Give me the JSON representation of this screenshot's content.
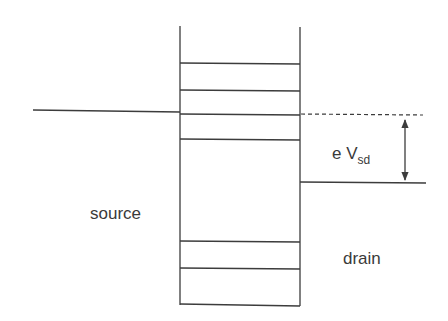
{
  "diagram": {
    "type": "energy-level-diagram",
    "labels": {
      "source": "source",
      "drain": "drain",
      "bias_prefix": "e V",
      "bias_subscript": "sd"
    },
    "colors": {
      "line": "#3c3c3c",
      "text": "#3a3a3a",
      "background": "#ffffff"
    },
    "well": {
      "left_x": 180,
      "right_x": 300,
      "top_y": 26,
      "bottom_y": 305,
      "level_y": [
        63,
        90,
        114,
        139,
        241,
        268
      ]
    },
    "source_fermi_level": {
      "x1": 33,
      "y1": 110,
      "x2": 180,
      "y2": 112
    },
    "drain_fermi_level": {
      "x1": 300,
      "y1": 182,
      "x2": 426,
      "y2": 183
    },
    "reference_dashed_line": {
      "x1": 300,
      "y1": 114,
      "x2": 423,
      "y2": 115
    },
    "bias_arrow": {
      "x": 405,
      "y1": 120,
      "y2": 180
    }
  }
}
